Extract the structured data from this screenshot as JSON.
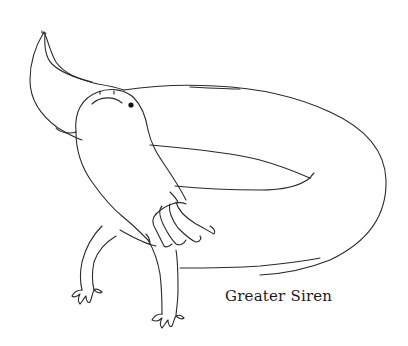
{
  "illustration": {
    "subject": "greater-siren",
    "caption": "Greater Siren",
    "style": "black line drawing on white",
    "colors": {
      "background": "#ffffff",
      "line": "#2a2a2a",
      "eye": "#111111"
    }
  }
}
